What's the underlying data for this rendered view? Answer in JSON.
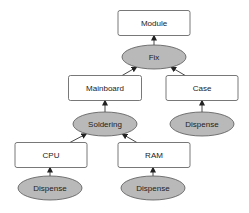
{
  "diagram": {
    "type": "assembly-tree",
    "nodes": [
      {
        "id": "module",
        "label": "Module",
        "kind": "component"
      },
      {
        "id": "fix",
        "label": "Fix",
        "kind": "operation"
      },
      {
        "id": "mainboard",
        "label": "Mainboard",
        "kind": "component"
      },
      {
        "id": "case",
        "label": "Case",
        "kind": "component"
      },
      {
        "id": "soldering",
        "label": "Soldering",
        "kind": "operation"
      },
      {
        "id": "dispense_case",
        "label": "Dispense",
        "kind": "operation"
      },
      {
        "id": "cpu",
        "label": "CPU",
        "kind": "component"
      },
      {
        "id": "ram",
        "label": "RAM",
        "kind": "component"
      },
      {
        "id": "dispense_cpu",
        "label": "Dispense",
        "kind": "operation"
      },
      {
        "id": "dispense_ram",
        "label": "Dispense",
        "kind": "operation"
      }
    ],
    "edges": [
      {
        "from": "fix",
        "to": "module"
      },
      {
        "from": "mainboard",
        "to": "fix"
      },
      {
        "from": "case",
        "to": "fix"
      },
      {
        "from": "soldering",
        "to": "mainboard"
      },
      {
        "from": "dispense_case",
        "to": "case"
      },
      {
        "from": "cpu",
        "to": "soldering"
      },
      {
        "from": "ram",
        "to": "soldering"
      },
      {
        "from": "dispense_cpu",
        "to": "cpu"
      },
      {
        "from": "dispense_ram",
        "to": "ram"
      }
    ],
    "colors": {
      "component_fill": "#ffffff",
      "operation_fill": "#b9b9b9",
      "stroke": "#555555"
    }
  }
}
